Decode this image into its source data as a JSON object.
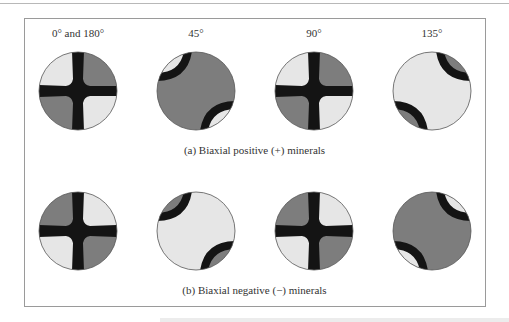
{
  "figure": {
    "colors": {
      "light": "#e6e6e6",
      "dark_gray": "#7d7d7d",
      "isogyre": "#141414",
      "outline": "#555555"
    },
    "column_labels": [
      "0° and 180°",
      "45°",
      "90°",
      "135°"
    ],
    "rows": [
      {
        "caption": "(a) Biaxial positive (+) minerals",
        "sign": "positive",
        "panels": [
          {
            "angle": "0° and 180°",
            "pattern": "cross",
            "quadrants": {
              "nw": "light",
              "ne": "dark",
              "sw": "dark",
              "se": "light"
            }
          },
          {
            "angle": "45°",
            "pattern": "split-isogyres",
            "corners": "light",
            "center": "dark"
          },
          {
            "angle": "90°",
            "pattern": "cross",
            "quadrants": {
              "nw": "light",
              "ne": "dark",
              "sw": "dark",
              "se": "light"
            }
          },
          {
            "angle": "135°",
            "pattern": "split-isogyres",
            "corners": "dark",
            "center": "light"
          }
        ]
      },
      {
        "caption": "(b) Biaxial negative (−) minerals",
        "sign": "negative",
        "panels": [
          {
            "angle": "0° and 180°",
            "pattern": "cross",
            "quadrants": {
              "nw": "dark",
              "ne": "light",
              "sw": "light",
              "se": "dark"
            }
          },
          {
            "angle": "45°",
            "pattern": "split-isogyres",
            "corners": "dark",
            "center": "light"
          },
          {
            "angle": "90°",
            "pattern": "cross",
            "quadrants": {
              "nw": "dark",
              "ne": "light",
              "sw": "light",
              "se": "dark"
            }
          },
          {
            "angle": "135°",
            "pattern": "split-isogyres",
            "corners": "light",
            "center": "dark"
          }
        ]
      }
    ]
  }
}
